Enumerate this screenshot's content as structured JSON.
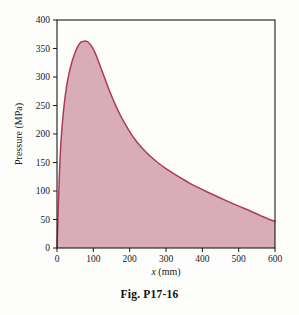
{
  "figure": {
    "caption": "Fig. P17-16"
  },
  "chart_data": {
    "type": "area",
    "title": "",
    "subtitle": "",
    "xlabel": "x (mm)",
    "xlabel_italic_part": "x",
    "xlabel_rest": " (mm)",
    "ylabel": "Pressure (MPa)",
    "xlim": [
      0,
      600
    ],
    "ylim": [
      0,
      400
    ],
    "xticks": [
      0,
      100,
      200,
      300,
      400,
      500,
      600
    ],
    "yticks": [
      0,
      50,
      100,
      150,
      200,
      250,
      300,
      350,
      400
    ],
    "xtick_labels": [
      "0",
      "100",
      "200",
      "300",
      "400",
      "500",
      "600"
    ],
    "ytick_labels": [
      "0",
      "50",
      "100",
      "150",
      "200",
      "250",
      "300",
      "350",
      "400"
    ],
    "grid": false,
    "legend": false,
    "legend_position": "none",
    "fill_color": "#d8adb8",
    "line_color": "#b03a55",
    "axis_color": "#1a1a1a",
    "peak": {
      "x": 78,
      "y": 363
    },
    "endpoint": {
      "x": 600,
      "y": 47
    },
    "series": [
      {
        "name": "Pressure",
        "x": [
          0,
          3,
          6,
          10,
          15,
          20,
          26,
          33,
          40,
          48,
          56,
          64,
          70,
          78,
          86,
          94,
          103,
          112,
          122,
          133,
          145,
          158,
          172,
          187,
          203,
          220,
          238,
          257,
          277,
          298,
          320,
          343,
          367,
          392,
          418,
          445,
          473,
          502,
          532,
          563,
          585,
          600
        ],
        "values": [
          0,
          62,
          118,
          176,
          221,
          253,
          282,
          306,
          324,
          340,
          352,
          360,
          362,
          363,
          361,
          355,
          345,
          331,
          314,
          295,
          275,
          255,
          236,
          218,
          201,
          186,
          173,
          161,
          150,
          140,
          131,
          122,
          113,
          105,
          97,
          89,
          81,
          73,
          65,
          56,
          50,
          47
        ]
      }
    ]
  }
}
